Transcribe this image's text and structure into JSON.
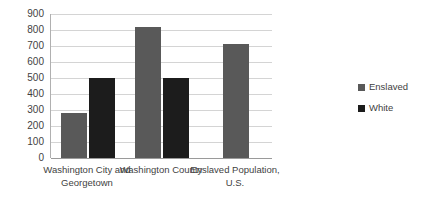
{
  "chart_data": {
    "type": "bar",
    "title": "",
    "subtitle": "",
    "xlabel": "",
    "ylabel": "",
    "ylim": [
      0,
      900
    ],
    "ytick_step": 100,
    "yticks": [
      "900",
      "800",
      "700",
      "600",
      "500",
      "400",
      "300",
      "200",
      "100",
      "0"
    ],
    "grid": "horizontal",
    "legend_position": "right",
    "categories": [
      "Washington City and Georgetown",
      "Washington County",
      "Enslaved Population, U.S."
    ],
    "series": [
      {
        "name": "Enslaved",
        "color": "#595959",
        "values": [
          280,
          820,
          710
        ]
      },
      {
        "name": "White",
        "color": "#1c1c1c",
        "values": [
          500,
          500,
          null
        ]
      }
    ]
  },
  "legend": {
    "items": [
      {
        "label": "Enslaved",
        "color": "#595959"
      },
      {
        "label": "White",
        "color": "#1c1c1c"
      }
    ]
  },
  "axis": {
    "gridline_color": "#d4d4d4",
    "axis_color": "#9a9a9a"
  }
}
